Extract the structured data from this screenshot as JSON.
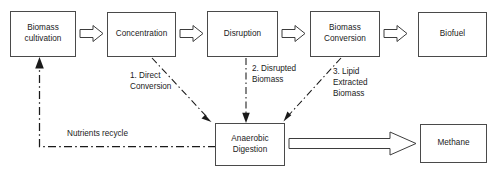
{
  "diagram": {
    "colors": {
      "box_stroke": "#4a4a4a",
      "arrow_stroke": "#3d3d3d",
      "dash_stroke": "#1a1a1a",
      "text": "#1a1a1a",
      "background": "#ffffff"
    },
    "nodes": [
      {
        "id": "biomass-cultivation",
        "label": "Biomass\ncultivation"
      },
      {
        "id": "concentration",
        "label": "Concentration"
      },
      {
        "id": "disruption",
        "label": "Disruption"
      },
      {
        "id": "biomass-conversion",
        "label": "Biomass\nConversion"
      },
      {
        "id": "biofuel",
        "label": "Biofuel"
      },
      {
        "id": "anaerobic-digestion",
        "label": "Anaerobic\nDigestion"
      },
      {
        "id": "methane",
        "label": "Methane"
      }
    ],
    "edge_labels": [
      {
        "id": "direct-conversion",
        "text": "1. Direct\nConversion"
      },
      {
        "id": "disrupted-biomass",
        "text": "2. Disrupted\nBiomass"
      },
      {
        "id": "lipid-extracted-biomass",
        "text": "3. Lipid\nExtracted\nBiomass"
      },
      {
        "id": "nutrients-recycle",
        "text": "Nutrients recycle"
      }
    ]
  }
}
